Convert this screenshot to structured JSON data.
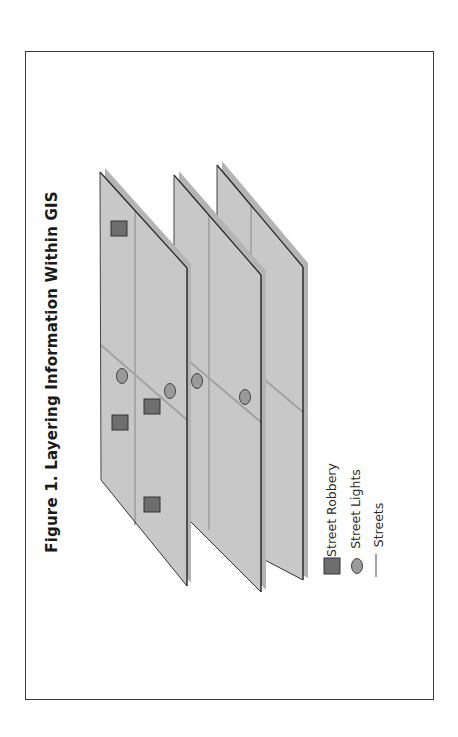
{
  "figure": {
    "title": "Figure 1. Layering Information Within GIS"
  },
  "layers": [
    {
      "name": "street-robbery-layer",
      "robberies": 4,
      "lights": 2
    },
    {
      "name": "street-lights-layer",
      "robberies": 0,
      "lights": 2
    },
    {
      "name": "streets-layer",
      "robberies": 0,
      "lights": 0
    }
  ],
  "legend": {
    "items": [
      {
        "label": "Street Robbery",
        "symbol": "square"
      },
      {
        "label": "Street Lights",
        "symbol": "ellipse"
      },
      {
        "label": "Streets",
        "symbol": "line"
      }
    ]
  },
  "colors": {
    "layer_fill": "#c8c8c8",
    "layer_shadow": "#b4b4b4",
    "layer_edge": "#222222",
    "street": "#a2a2a2",
    "robbery": "#6e6e6e",
    "light": "#9a9a9a"
  }
}
